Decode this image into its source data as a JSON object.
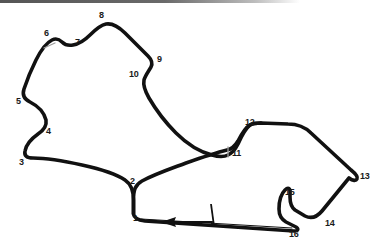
{
  "diagram": {
    "type": "racing-circuit-map",
    "background_color": "#ffffff",
    "track_color": "#111111",
    "track_width_px": 3.6,
    "label_color": "#1a1a1a",
    "sector_marker_color": "#9a9a9a",
    "header_bar": {
      "color_start": "#555555",
      "color_end": "#ffffff",
      "width": 300,
      "height": 3
    },
    "direction": "counter-clockwise",
    "start_finish": {
      "label": "start-finish-line",
      "x": 211,
      "y": 214
    },
    "direction_arrow": {
      "label": "direction-of-travel-arrow",
      "points": "left",
      "x": 186,
      "y": 222
    },
    "turn_count": 16,
    "turns": [
      {
        "number": "1",
        "x": 133,
        "y": 216,
        "anchor_x": 128,
        "anchor_y": 209
      },
      {
        "number": "2",
        "x": 130,
        "y": 179,
        "anchor_x": 130,
        "anchor_y": 188
      },
      {
        "number": "3",
        "x": 20,
        "y": 160,
        "anchor_x": 28,
        "anchor_y": 155
      },
      {
        "number": "4",
        "x": 46,
        "y": 130,
        "anchor_x": 38,
        "anchor_y": 134
      },
      {
        "number": "5",
        "x": 18,
        "y": 100,
        "anchor_x": 25,
        "anchor_y": 101
      },
      {
        "number": "6",
        "x": 45,
        "y": 33,
        "anchor_x": 52,
        "anchor_y": 40
      },
      {
        "number": "7",
        "x": 76,
        "y": 41,
        "anchor_x": 74,
        "anchor_y": 36
      },
      {
        "number": "8",
        "x": 100,
        "y": 15,
        "anchor_x": 101,
        "anchor_y": 22
      },
      {
        "number": "9",
        "x": 158,
        "y": 59,
        "anchor_x": 152,
        "anchor_y": 58
      },
      {
        "number": "10",
        "x": 131,
        "y": 74,
        "anchor_x": 142,
        "anchor_y": 72
      },
      {
        "number": "11",
        "x": 237,
        "y": 152,
        "anchor_x": 228,
        "anchor_y": 143
      },
      {
        "number": "12",
        "x": 249,
        "y": 122,
        "anchor_x": 247,
        "anchor_y": 131
      },
      {
        "number": "13",
        "x": 362,
        "y": 176,
        "anchor_x": 355,
        "anchor_y": 172
      },
      {
        "number": "14",
        "x": 327,
        "y": 224,
        "anchor_x": 325,
        "anchor_y": 217
      },
      {
        "number": "15",
        "x": 288,
        "y": 193,
        "anchor_x": 289,
        "anchor_y": 201
      },
      {
        "number": "16",
        "x": 292,
        "y": 231,
        "anchor_x": 287,
        "anchor_y": 224
      }
    ],
    "sector_markers": [
      {
        "name": "sector-marker-near-turn-6",
        "x": 49,
        "y": 46
      },
      {
        "name": "sector-marker-near-turn-11",
        "x": 228,
        "y": 142
      }
    ],
    "track_path": "M 133 214 L 133 201 C 133 193 135 188 141 185 C 151 180 162 176 174 172 C 196 164 214 158 225 156 C 232 155 236 154 237 152 C 239 149 243 141 246 136 C 247 133 249 131 253 131 L 289 132 C 296 132 302 134 307 139 L 352 174 C 356 177 357 179 356 181 C 355 183 352 183 349 181 L 320 216 C 316 220 311 221 306 218 L 294 211 C 291 209 290 205 290 200 L 290 196 C 290 193 288 192 286 195 C 283 199 281 205 281 212 C 281 217 283 220 287 222 L 295 226 C 297 227 296 229 293 229 L 143 218 C 137 217 134 216 133 214 Z",
    "track_path_main": "M 133 215 L 133 200 C 133 191 134 186 140 183 C 150 177 163 173 176 168 C 200 160 216 155 226 153 C 231 152 234 150 236 147 C 239 142 243 135 246 132 C 248 130 250 129 254 129 L 288 130 C 296 130 303 133 308 138 L 351 173 C 355 176 356 178 355 180 C 353 182 350 182 347 180",
    "annotations": []
  }
}
